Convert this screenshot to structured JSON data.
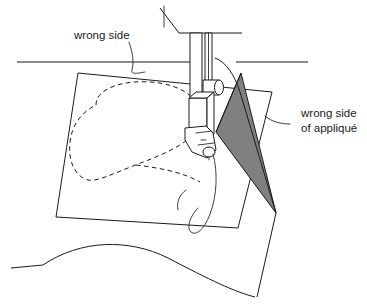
{
  "figure": {
    "type": "line-art-diagram",
    "background_color": "#ffffff",
    "line_color": "#1a1a1a",
    "applique_fill_color": "#808080"
  },
  "labels": {
    "wrong_side": "wrong side",
    "applique_line1": "wrong side",
    "applique_line2": "of appliqué"
  },
  "parts": {
    "needle_bar": "needle-bar",
    "presser_foot": "presser-foot",
    "presser_bar": "presser-bar",
    "thread_take_up_guide": "thread-guide",
    "machine_bed": "machine-bed-edge",
    "machine_arm": "machine-arm-edge",
    "background_fabric": "background-fabric",
    "applique_square": "applique-fabric-square",
    "folded_applique": "folded-applique-triangle",
    "stitch_line": "dashed-stitching-line",
    "thread_tail": "thread-tail"
  }
}
